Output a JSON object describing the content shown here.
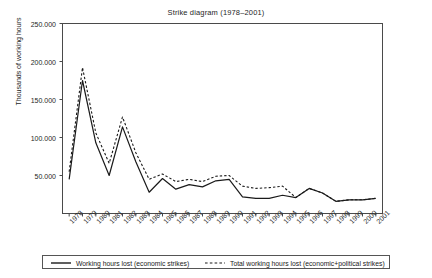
{
  "chart_data": {
    "type": "line",
    "title": "Strike diagram (1978–2001)",
    "xlabel": "",
    "ylabel": "Thousands of working hours",
    "ylim": [
      0,
      250000
    ],
    "ytick_labels": [
      "250.000",
      "200.000",
      "150.000",
      "100.000",
      "50.000"
    ],
    "ytick_values": [
      250000,
      200000,
      150000,
      100000,
      50000
    ],
    "grid": false,
    "legend_position": "bottom",
    "categories": [
      "1978",
      "1979",
      "1980",
      "1981",
      "1982",
      "1983",
      "1984",
      "1985",
      "1986",
      "1987",
      "1988",
      "1989",
      "1990",
      "1991",
      "1992",
      "1993",
      "1994",
      "1995",
      "1996",
      "1997",
      "1998",
      "1999",
      "2000",
      "2001"
    ],
    "series": [
      {
        "name": "Working hours lost (economic strikes)",
        "style": "solid",
        "values": [
          45000,
          175000,
          93000,
          50000,
          114000,
          68000,
          28000,
          46000,
          32000,
          38000,
          35000,
          43000,
          45000,
          22000,
          20000,
          20000,
          24000,
          21000,
          33000,
          27000,
          16000,
          18000,
          18000,
          20000
        ]
      },
      {
        "name": "Total working hours lost (economic+political strikes)",
        "style": "dashed",
        "values": [
          55000,
          192000,
          106000,
          66000,
          127000,
          80000,
          45000,
          52000,
          42000,
          45000,
          42000,
          49000,
          50000,
          36000,
          33000,
          34000,
          36000,
          21000,
          33000,
          27000,
          16000,
          18000,
          18000,
          20000
        ]
      }
    ]
  },
  "legend": {
    "items": [
      {
        "label": "Working hours lost (economic strikes)",
        "style": "solid"
      },
      {
        "label": "Total working hours lost (economic+political strikes)",
        "style": "dashed"
      }
    ]
  }
}
